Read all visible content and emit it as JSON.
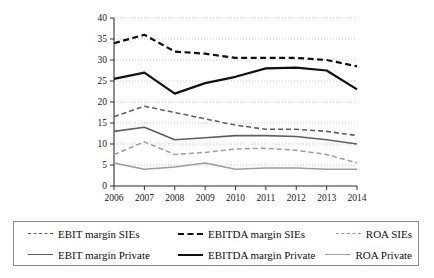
{
  "chart_data": {
    "type": "line",
    "title": "",
    "xlabel": "",
    "ylabel": "",
    "x": [
      "2006",
      "2007",
      "2008",
      "2009",
      "2010",
      "2011",
      "2012",
      "2013",
      "2014"
    ],
    "ylim": [
      0,
      40
    ],
    "yticks": [
      "0",
      "5",
      "10",
      "15",
      "20",
      "25",
      "30",
      "35",
      "40"
    ],
    "grid": true,
    "legend_position": "bottom",
    "series": [
      {
        "name": "EBIT margin SIEs",
        "style": "dashed",
        "color": "#5f5f5f",
        "width": 1.6,
        "values": [
          16.5,
          19.0,
          17.5,
          16.0,
          14.5,
          13.5,
          13.5,
          13.0,
          12.0
        ]
      },
      {
        "name": "EBITDA margin SIEs",
        "style": "dashed",
        "color": "#111111",
        "width": 2.2,
        "values": [
          34.0,
          36.0,
          32.0,
          31.5,
          30.5,
          30.5,
          30.5,
          30.0,
          28.5
        ]
      },
      {
        "name": "ROA SIEs",
        "style": "dashed",
        "color": "#9d9d9d",
        "width": 1.5,
        "values": [
          7.5,
          10.5,
          7.5,
          8.0,
          8.8,
          9.0,
          8.5,
          7.5,
          5.5
        ]
      },
      {
        "name": "EBIT margin Private",
        "style": "solid",
        "color": "#5f5f5f",
        "width": 1.6,
        "values": [
          13.0,
          14.0,
          11.0,
          11.5,
          12.0,
          12.0,
          11.8,
          11.0,
          10.0
        ]
      },
      {
        "name": "EBITDA margin Private",
        "style": "solid",
        "color": "#111111",
        "width": 2.2,
        "values": [
          25.5,
          27.0,
          22.0,
          24.5,
          26.0,
          28.0,
          28.2,
          27.5,
          23.0
        ]
      },
      {
        "name": "ROA Private",
        "style": "solid",
        "color": "#9d9d9d",
        "width": 1.5,
        "values": [
          5.5,
          4.0,
          4.5,
          5.5,
          4.0,
          4.3,
          4.3,
          4.0,
          4.0
        ]
      }
    ]
  },
  "legend": {
    "rows": [
      [
        {
          "label": "EBIT margin SIEs",
          "swatch": "sw-ebit-d"
        },
        {
          "label": "EBITDA margin SIEs",
          "swatch": "sw-ebitda-d"
        },
        {
          "label": "ROA SIEs",
          "swatch": "sw-roa-d"
        }
      ],
      [
        {
          "label": "EBIT margin Private",
          "swatch": "sw-ebit-s"
        },
        {
          "label": "EBITDA margin Private",
          "swatch": "sw-ebitda-s"
        },
        {
          "label": "ROA Private",
          "swatch": "sw-roa-s"
        }
      ]
    ]
  }
}
